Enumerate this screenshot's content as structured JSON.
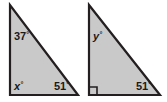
{
  "figure": {
    "type": "geometry-diagram",
    "background_color": "#ffffff",
    "fill_color": "#c9c9c9",
    "stroke_color": "#231f20",
    "label_color": "#1a1a1a",
    "degree_symbol": "°",
    "shapes": [
      {
        "name": "left-triangle",
        "vertices": [
          {
            "x": 10,
            "y": 5
          },
          {
            "x": 10,
            "y": 95
          },
          {
            "x": 78,
            "y": 95
          }
        ],
        "right_angle_marker": false,
        "labels": [
          {
            "name": "angle-37",
            "text": "37",
            "suffix": "°",
            "italic": false,
            "x": 14,
            "y": 40
          },
          {
            "name": "angle-x",
            "text": "x",
            "suffix": "°",
            "italic": true,
            "x": 14,
            "y": 90
          },
          {
            "name": "angle-51-left",
            "text": "51",
            "suffix": "°",
            "italic": false,
            "x": 54,
            "y": 90
          }
        ]
      },
      {
        "name": "right-triangle",
        "vertices": [
          {
            "x": 89,
            "y": 5
          },
          {
            "x": 89,
            "y": 95
          },
          {
            "x": 160,
            "y": 95
          }
        ],
        "right_angle_marker": true,
        "right_angle_marker_size": 8,
        "labels": [
          {
            "name": "angle-y",
            "text": "y",
            "suffix": "°",
            "italic": true,
            "x": 93,
            "y": 40
          },
          {
            "name": "angle-51-right",
            "text": "51",
            "suffix": "°",
            "italic": false,
            "x": 136,
            "y": 90
          }
        ]
      }
    ]
  }
}
